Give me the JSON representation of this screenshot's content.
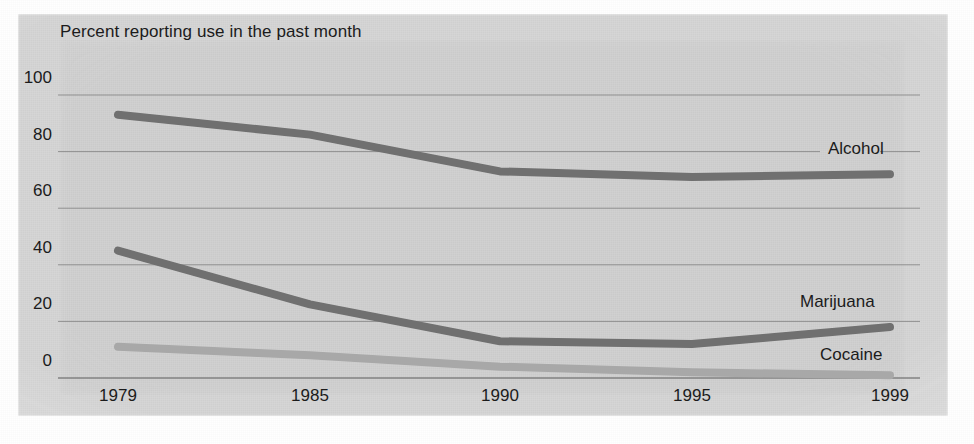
{
  "chart_data": {
    "type": "line",
    "title": "Percent reporting use in the past month",
    "xlabel": "",
    "ylabel": "",
    "ylim": [
      0,
      100
    ],
    "yticks": [
      0,
      20,
      40,
      60,
      80,
      100
    ],
    "ytick_labels": [
      "0",
      "20",
      "40",
      "60",
      "80",
      "100"
    ],
    "x": [
      1979,
      1985,
      1990,
      1995,
      1999
    ],
    "xtick_labels": [
      "1979",
      "1985",
      "1990",
      "1995",
      "1999"
    ],
    "grid": true,
    "legend_position": "inline-right",
    "series": [
      {
        "name": "Alcohol",
        "color": "#6f6f6f",
        "values": [
          93,
          86,
          73,
          71,
          72
        ]
      },
      {
        "name": "Marijuana",
        "color": "#6f6f6f",
        "values": [
          45,
          26,
          13,
          12,
          18
        ]
      },
      {
        "name": "Cocaine",
        "color": "#a8a8a8",
        "values": [
          11,
          8,
          4,
          2,
          1
        ]
      }
    ],
    "annotations": [
      {
        "text": "Alcohol",
        "x": 1999,
        "y": 80
      },
      {
        "text": "Marijuana",
        "x": 1999,
        "y": 27
      },
      {
        "text": "Cocaine",
        "x": 1999,
        "y": 9
      }
    ],
    "colors": {
      "background": "#d2d2d2",
      "page": "#ffffff",
      "gridline": "#7a7a7a",
      "text": "#1b1b1b",
      "dark_series": "#6f6f6f",
      "light_series": "#a8a8a8"
    }
  }
}
